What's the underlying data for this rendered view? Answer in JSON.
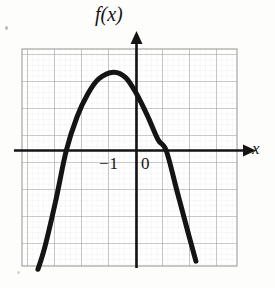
{
  "figure": {
    "kind": "graph-figure",
    "background_color": "#fdfdfc",
    "ink_color": "#141414",
    "grid_major_color": "#9a9a97",
    "grid_minor_color": "#c9c9c6"
  },
  "labels": {
    "function_label": "f(x)",
    "x_axis_label": "x",
    "tick_minus_one": "−1",
    "tick_zero": "0"
  },
  "chart_data": {
    "type": "line",
    "title": "",
    "subtitle": "",
    "xlabel": "x",
    "ylabel": "f(x)",
    "legend": [],
    "legend_position": "none",
    "grid": true,
    "grid_major_step": 1,
    "grid_minor_per_major": 5,
    "xlim": [
      -4.2,
      3.8
    ],
    "ylim": [
      -3.7,
      3.7
    ],
    "xticks": [
      -1,
      0
    ],
    "xtick_labels": [
      "−1",
      "0"
    ],
    "yticks": [],
    "ytick_labels": [],
    "axes": {
      "x_axis_at_y": 0,
      "y_axis_at_x": 0,
      "x_axis_arrow": "right",
      "y_axis_arrow": "up",
      "x_axis_label_text": "x",
      "y_axis_label_text": "f(x)"
    },
    "annotations": [
      {
        "text": "−1",
        "x": -1,
        "y": -0.45,
        "role": "x-tick-label"
      },
      {
        "text": "0",
        "x": 0.22,
        "y": -0.45,
        "role": "x-tick-label"
      },
      {
        "text": "f(x)",
        "x": -0.55,
        "y": 3.55,
        "role": "axis-label"
      },
      {
        "text": "x",
        "x": 3.75,
        "y": -0.18,
        "role": "axis-label"
      }
    ],
    "curve": {
      "name": "f(x)",
      "shape": "downward parabola",
      "equation": "f(x) = -1.1(x + 1)^2 + 2.9",
      "vertex": {
        "x": -0.85,
        "y": 2.9
      },
      "x_intercepts": [
        -2.6,
        1.1
      ],
      "opens": "down",
      "stroke_width_px": 5,
      "color": "#141414",
      "domain_drawn": [
        -3.65,
        2.2
      ],
      "points": [
        {
          "x": -3.65,
          "y": -4.4
        },
        {
          "x": -3.4,
          "y": -3.6
        },
        {
          "x": -3.0,
          "y": -1.9
        },
        {
          "x": -2.6,
          "y": 0.0
        },
        {
          "x": -2.2,
          "y": 1.25
        },
        {
          "x": -1.8,
          "y": 2.1
        },
        {
          "x": -1.4,
          "y": 2.65
        },
        {
          "x": -0.85,
          "y": 2.9
        },
        {
          "x": -0.4,
          "y": 2.7
        },
        {
          "x": 0.0,
          "y": 2.1
        },
        {
          "x": 0.4,
          "y": 1.3
        },
        {
          "x": 0.8,
          "y": 0.4
        },
        {
          "x": 1.1,
          "y": 0.0
        },
        {
          "x": 1.5,
          "y": -1.5
        },
        {
          "x": 1.9,
          "y": -3.0
        },
        {
          "x": 2.2,
          "y": -4.1
        }
      ]
    }
  }
}
